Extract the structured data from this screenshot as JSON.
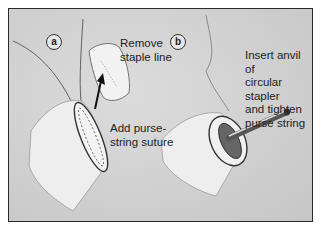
{
  "figure": {
    "panels": [
      {
        "id": "a",
        "label": "a",
        "captions": {
          "remove": "Remove\nstaple line",
          "add": "Add purse-\nstring suture"
        }
      },
      {
        "id": "b",
        "label": "b",
        "captions": {
          "insert": "Insert anvil of\ncircular stapler\nand tighten\npurse string"
        }
      }
    ],
    "colors": {
      "background": "#cfcfcf",
      "border": "#2a2a2a",
      "text": "#222222",
      "tissue": "#eeeeee"
    }
  }
}
